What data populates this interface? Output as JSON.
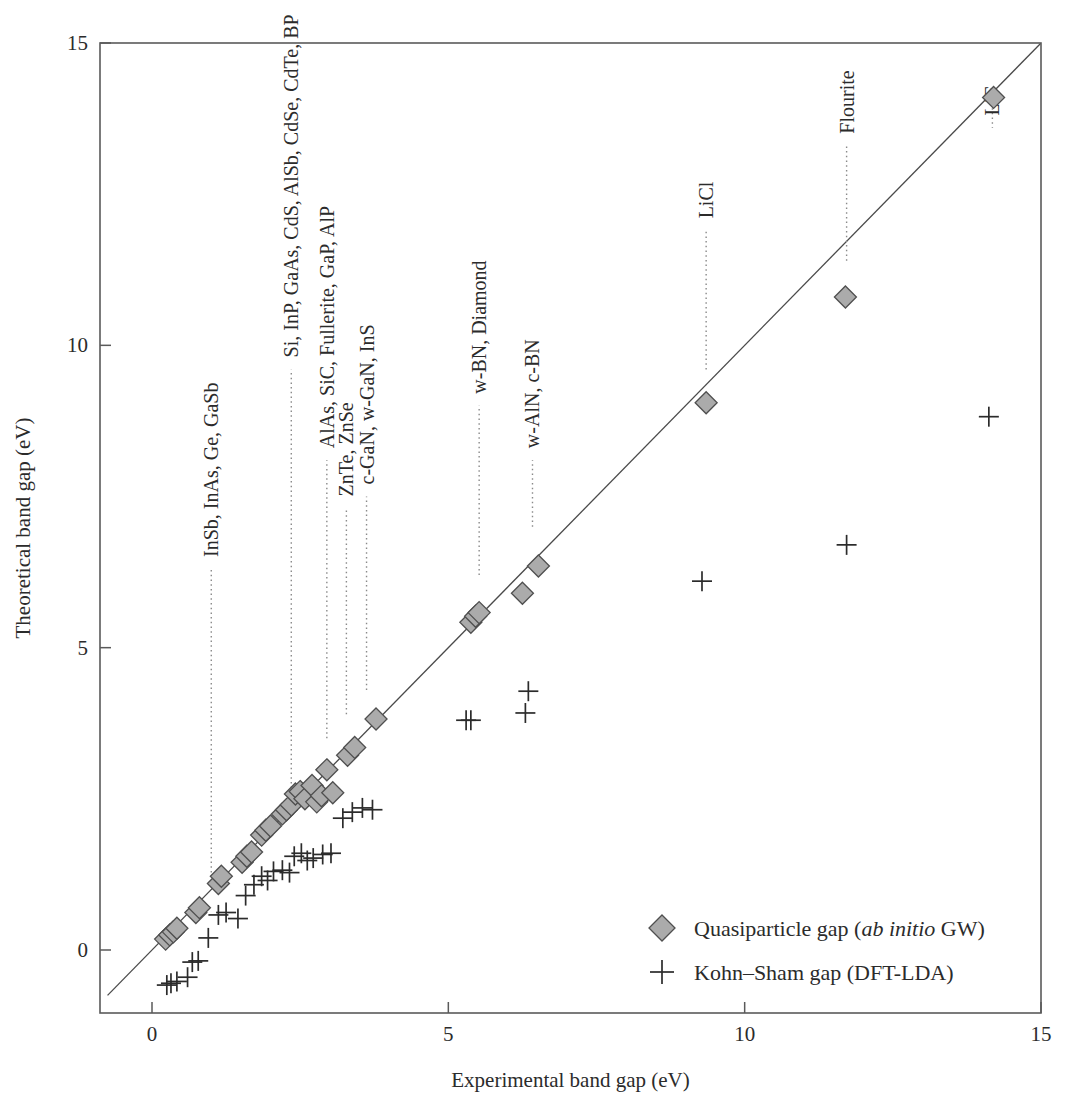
{
  "chart_data": {
    "type": "scatter",
    "title": "",
    "xlabel": "Experimental band gap (eV)",
    "ylabel": "Theoretical band gap (eV)",
    "xlim": [
      -0.75,
      15.2
    ],
    "ylim": [
      -1.2,
      15.3
    ],
    "xticks": [
      0,
      5,
      10,
      15
    ],
    "yticks": [
      0,
      5,
      10,
      15
    ],
    "xtick_labels": [
      "0",
      "5",
      "10",
      "15"
    ],
    "ytick_labels": [
      "0",
      "5",
      "10",
      "15"
    ],
    "grid": false,
    "reference_line": {
      "name": "parity-line",
      "from": [
        -0.75,
        -0.75
      ],
      "to": [
        15.2,
        15.2
      ]
    },
    "legend_position": "lower-right",
    "series": [
      {
        "name": "Quasiparticle gap (ab initio GW)",
        "marker": "diamond",
        "color": "#ababab",
        "points": [
          [
            0.23,
            0.18
          ],
          [
            0.3,
            0.25
          ],
          [
            0.36,
            0.3
          ],
          [
            0.42,
            0.36
          ],
          [
            0.74,
            0.62
          ],
          [
            0.8,
            0.7
          ],
          [
            1.12,
            1.1
          ],
          [
            1.17,
            1.22
          ],
          [
            1.52,
            1.45
          ],
          [
            1.6,
            1.55
          ],
          [
            1.68,
            1.62
          ],
          [
            1.85,
            1.9
          ],
          [
            1.92,
            1.98
          ],
          [
            2.0,
            2.05
          ],
          [
            2.2,
            2.25
          ],
          [
            2.27,
            2.32
          ],
          [
            2.35,
            2.4
          ],
          [
            2.42,
            2.58
          ],
          [
            2.5,
            2.62
          ],
          [
            2.58,
            2.5
          ],
          [
            2.7,
            2.72
          ],
          [
            2.78,
            2.45
          ],
          [
            2.86,
            2.55
          ],
          [
            2.95,
            2.98
          ],
          [
            3.05,
            2.6
          ],
          [
            3.3,
            3.22
          ],
          [
            3.42,
            3.35
          ],
          [
            3.78,
            3.82
          ],
          [
            5.38,
            5.42
          ],
          [
            5.46,
            5.52
          ],
          [
            5.52,
            5.58
          ],
          [
            6.25,
            5.9
          ],
          [
            6.52,
            6.35
          ],
          [
            9.35,
            9.05
          ],
          [
            11.7,
            10.8
          ],
          [
            14.2,
            14.1
          ]
        ]
      },
      {
        "name": "Kohn-Sham gap (DFT-LDA)",
        "marker": "plus",
        "color": "#2b2b2b",
        "points": [
          [
            0.25,
            -0.58
          ],
          [
            0.32,
            -0.55
          ],
          [
            0.42,
            -0.52
          ],
          [
            0.6,
            -0.45
          ],
          [
            0.68,
            -0.2
          ],
          [
            0.78,
            -0.18
          ],
          [
            0.95,
            0.2
          ],
          [
            1.12,
            0.58
          ],
          [
            1.25,
            0.62
          ],
          [
            1.45,
            0.52
          ],
          [
            1.58,
            0.9
          ],
          [
            1.72,
            1.08
          ],
          [
            1.85,
            1.22
          ],
          [
            1.95,
            1.15
          ],
          [
            2.05,
            1.3
          ],
          [
            2.2,
            1.32
          ],
          [
            2.32,
            1.28
          ],
          [
            2.4,
            1.55
          ],
          [
            2.52,
            1.6
          ],
          [
            2.62,
            1.48
          ],
          [
            2.72,
            1.52
          ],
          [
            2.88,
            1.58
          ],
          [
            3.02,
            1.6
          ],
          [
            3.22,
            2.18
          ],
          [
            3.38,
            2.28
          ],
          [
            3.55,
            2.35
          ],
          [
            3.72,
            2.32
          ],
          [
            5.3,
            3.8
          ],
          [
            5.38,
            3.8
          ],
          [
            6.3,
            3.92
          ],
          [
            6.35,
            4.28
          ],
          [
            9.28,
            6.1
          ],
          [
            11.72,
            6.7
          ],
          [
            14.12,
            8.82
          ]
        ]
      }
    ],
    "annotations": [
      {
        "label": "InSb, InAs, Ge, GaSb",
        "leader_x": 1.0,
        "leader_y_top": 6.3,
        "leader_y_bottom": 1.05,
        "text_y": 6.5
      },
      {
        "label": "Si, InP, GaAs, CdS, AlSb, CdSe, CdTe, BP",
        "leader_x": 2.35,
        "leader_y_top": 9.6,
        "leader_y_bottom": 2.6,
        "text_y": 9.8
      },
      {
        "label": "AlAs, SiC, Fullerite, GaP, AlP",
        "leader_x": 2.95,
        "leader_y_top": 8.1,
        "leader_y_bottom": 3.5,
        "text_y": 8.3
      },
      {
        "label": "ZnTe, ZnSe",
        "leader_x": 3.28,
        "leader_y_top": 7.3,
        "leader_y_bottom": 3.9,
        "text_y": 7.5
      },
      {
        "label": "c-GaN, w-GaN, InS",
        "leader_x": 3.62,
        "leader_y_top": 7.5,
        "leader_y_bottom": 4.3,
        "text_y": 7.7
      },
      {
        "label": "w-BN, Diamond",
        "leader_x": 5.52,
        "leader_y_top": 9.0,
        "leader_y_bottom": 6.2,
        "text_y": 9.2
      },
      {
        "label": "w-AlN, c-BN",
        "leader_x": 6.42,
        "leader_y_top": 8.1,
        "leader_y_bottom": 7.0,
        "text_y": 8.3
      },
      {
        "label": "LiCl",
        "leader_x": 9.35,
        "leader_y_top": 11.9,
        "leader_y_bottom": 9.6,
        "text_y": 12.1
      },
      {
        "label": "Flourite",
        "leader_x": 11.72,
        "leader_y_top": 13.3,
        "leader_y_bottom": 11.4,
        "text_y": 13.5
      },
      {
        "label": "LiF",
        "leader_x": 14.18,
        "leader_y_top": 13.6,
        "leader_y_bottom": 14.0,
        "text_y": 13.8
      }
    ],
    "legend": [
      {
        "marker": "diamond",
        "text_plain_1": "Quasiparticle gap (",
        "text_italic": "ab initio",
        "text_plain_2": " GW)"
      },
      {
        "marker": "plus",
        "text_plain_1": "Kohn–Sham gap (DFT-LDA)",
        "text_italic": "",
        "text_plain_2": ""
      }
    ]
  }
}
